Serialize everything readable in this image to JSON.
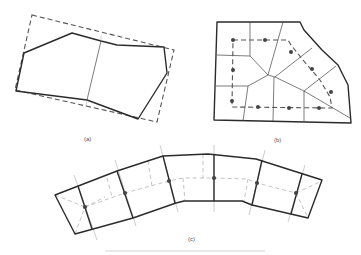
{
  "figure": {
    "panels": [
      {
        "id": "a",
        "label": "(a)",
        "description": "Polygon with two cells enclosed by dashed bounding rectangle"
      },
      {
        "id": "b",
        "label": "(b)",
        "description": "Cell mesh with dashed loop path and dot nodes"
      },
      {
        "id": "c",
        "label": "(c)",
        "description": "Curved strip divided into cells with dashed centerline and dot nodes"
      }
    ],
    "caption": ""
  },
  "colors": {
    "line": "#2b2b2b",
    "dashed": "#555555",
    "faint": "#9a9a9a",
    "dot": "#444444",
    "background": "#ffffff"
  }
}
